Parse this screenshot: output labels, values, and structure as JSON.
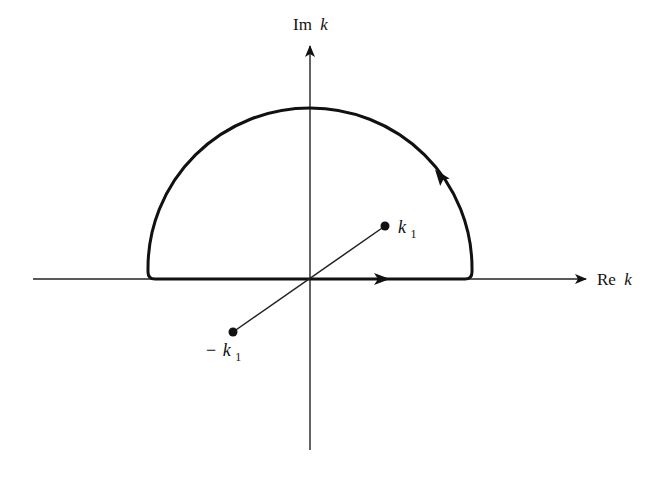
{
  "diagram": {
    "type": "complex-plane-contour",
    "colors": {
      "background": "#ffffff",
      "ink": "#111111",
      "axis": "#222222"
    },
    "axes": {
      "real": {
        "label_prefix": "Re",
        "label_var": "k"
      },
      "imag": {
        "label_prefix": "Im",
        "label_var": "k"
      }
    },
    "contour": {
      "shape": "upper-semicircle-closed-by-real-axis",
      "direction": "counterclockwise"
    },
    "points": [
      {
        "id": "k1",
        "label_sign": "",
        "label_var": "k",
        "label_sub": "1"
      },
      {
        "id": "minus-k1",
        "label_sign": "−",
        "label_var": "k",
        "label_sub": "1"
      }
    ]
  }
}
